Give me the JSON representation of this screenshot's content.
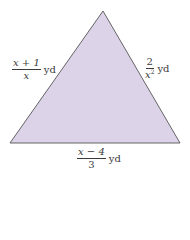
{
  "figure": {
    "shape": "triangle",
    "fill_color": "#dcd3e8",
    "stroke_color": "#555555",
    "vertices": {
      "apex": [
        103,
        11
      ],
      "bottom_left": [
        10,
        143
      ],
      "bottom_right": [
        180,
        143
      ]
    }
  },
  "labels": {
    "left_side": {
      "numerator": "x + 1",
      "denominator": "x",
      "unit": "yd"
    },
    "right_side": {
      "numerator": "2",
      "denominator_base": "x",
      "denominator_exponent": "2",
      "unit": "yd"
    },
    "bottom_side": {
      "numerator": "x − 4",
      "denominator": "3",
      "unit": "yd"
    }
  }
}
